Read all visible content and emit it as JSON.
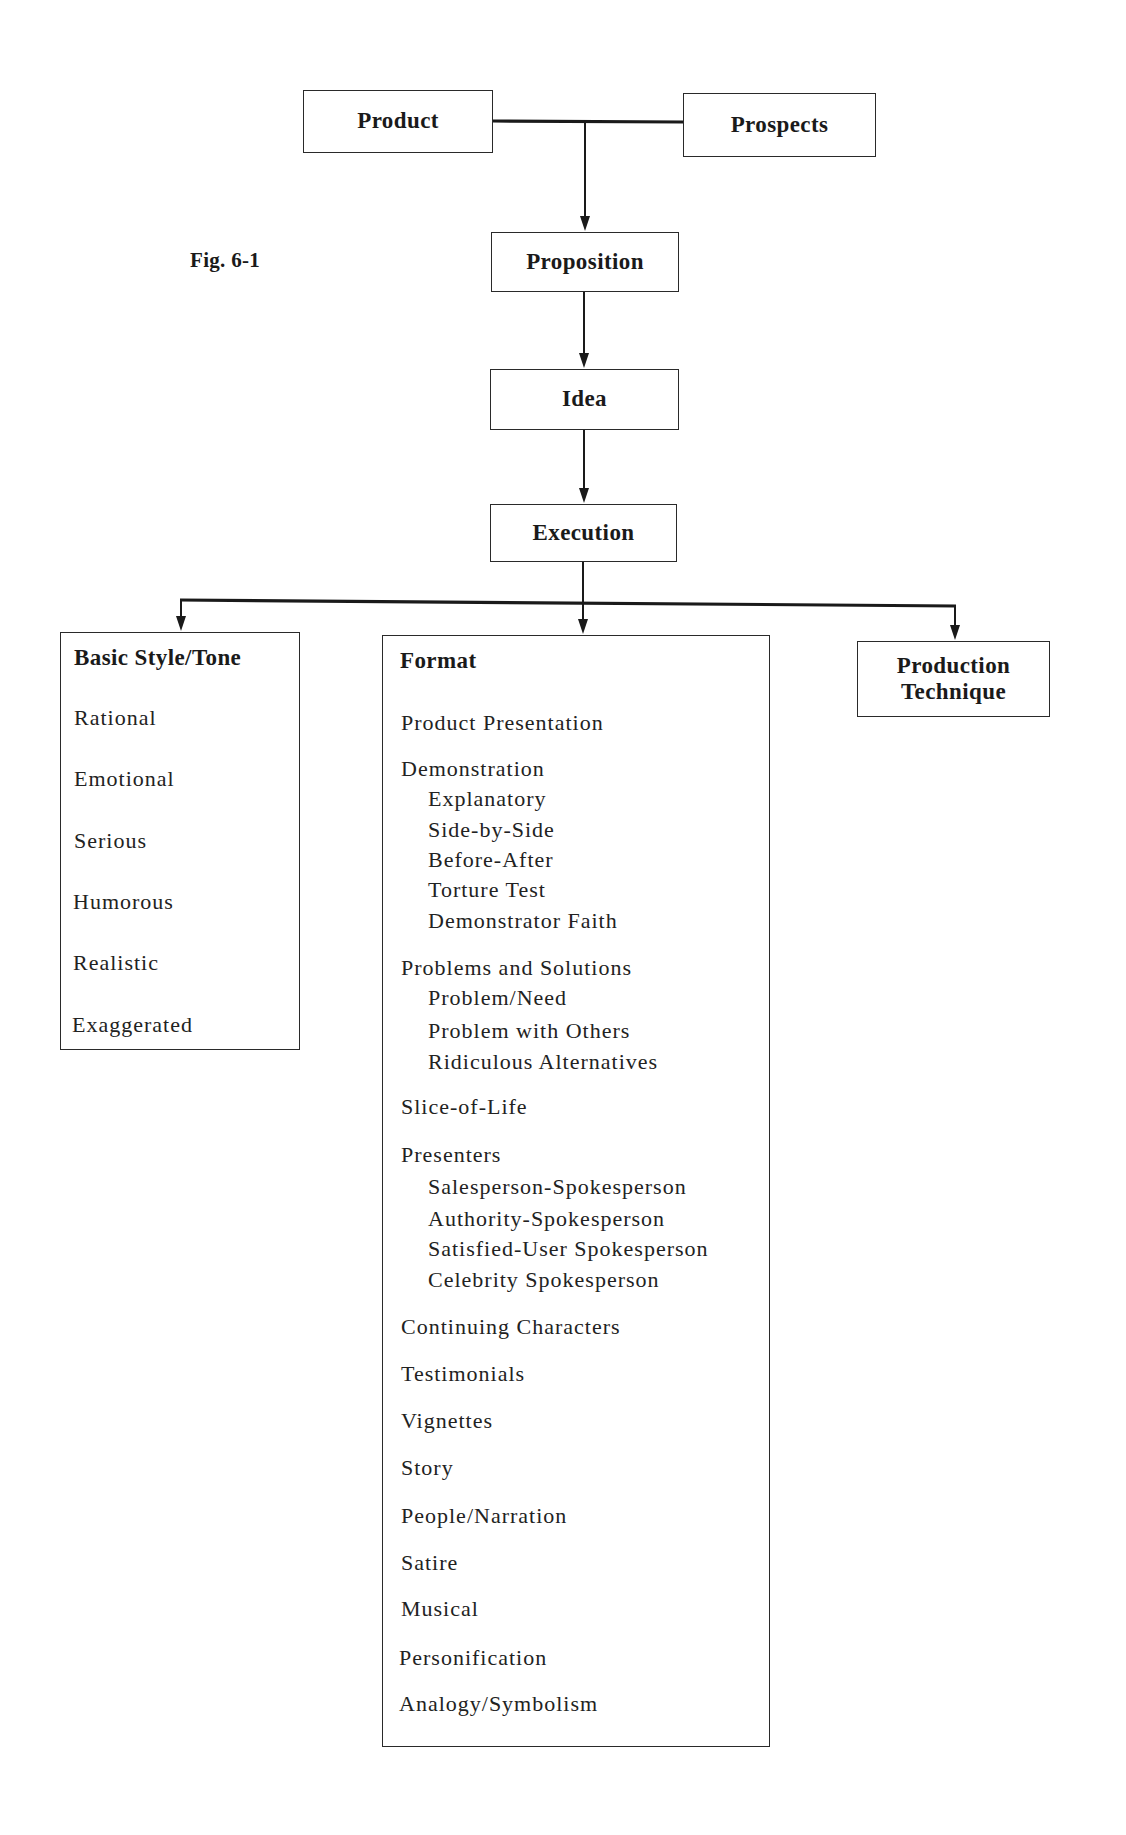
{
  "figure_label": "Fig. 6-1",
  "top_nodes": {
    "product": "Product",
    "prospects": "Prospects",
    "proposition": "Proposition",
    "idea": "Idea",
    "execution": "Execution"
  },
  "branches": {
    "basic_style": {
      "title": "Basic Style/Tone",
      "items": [
        "Rational",
        "Emotional",
        "Serious",
        "Humorous",
        "Realistic",
        "Exaggerated"
      ]
    },
    "format": {
      "title": "Format",
      "items": [
        {
          "label": "Product Presentation",
          "level": 0
        },
        {
          "label": "Demonstration",
          "level": 0
        },
        {
          "label": "Explanatory",
          "level": 1
        },
        {
          "label": "Side-by-Side",
          "level": 1
        },
        {
          "label": "Before-After",
          "level": 1
        },
        {
          "label": "Torture Test",
          "level": 1
        },
        {
          "label": "Demonstrator Faith",
          "level": 1
        },
        {
          "label": "Problems and Solutions",
          "level": 0
        },
        {
          "label": "Problem/Need",
          "level": 1
        },
        {
          "label": "Problem with Others",
          "level": 1
        },
        {
          "label": "Ridiculous Alternatives",
          "level": 1
        },
        {
          "label": "Slice-of-Life",
          "level": 0
        },
        {
          "label": "Presenters",
          "level": 0
        },
        {
          "label": "Salesperson-Spokesperson",
          "level": 1
        },
        {
          "label": "Authority-Spokesperson",
          "level": 1
        },
        {
          "label": "Satisfied-User Spokesperson",
          "level": 1
        },
        {
          "label": "Celebrity Spokesperson",
          "level": 1
        },
        {
          "label": "Continuing Characters",
          "level": 0
        },
        {
          "label": "Testimonials",
          "level": 0
        },
        {
          "label": "Vignettes",
          "level": 0
        },
        {
          "label": "Story",
          "level": 0
        },
        {
          "label": "People/Narration",
          "level": 0
        },
        {
          "label": "Satire",
          "level": 0
        },
        {
          "label": "Musical",
          "level": 0
        },
        {
          "label": "Personification",
          "level": 0
        },
        {
          "label": "Analogy/Symbolism",
          "level": 0
        }
      ]
    },
    "production_technique": {
      "title_line1": "Production",
      "title_line2": "Technique"
    }
  },
  "colors": {
    "line": "#1a1a1a",
    "background": "#ffffff"
  }
}
